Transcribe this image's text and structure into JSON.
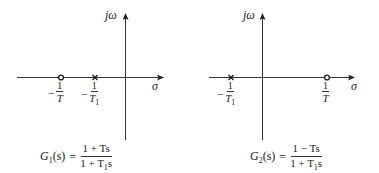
{
  "diagrams": [
    {
      "id": "left",
      "axes": {
        "vertical_label": "jω",
        "horizontal_label": "σ"
      },
      "markers": [
        {
          "type": "zero",
          "symbol": "o",
          "label_sign": "−",
          "label_num": "1",
          "label_den": "T",
          "label_den_sub": ""
        },
        {
          "type": "pole",
          "symbol": "×",
          "label_sign": "−",
          "label_num": "1",
          "label_den": "T",
          "label_den_sub": "1"
        }
      ],
      "transfer_function": {
        "lhs_name": "G",
        "lhs_sub": "1",
        "lhs_arg": "(s)",
        "equals": "=",
        "numerator": "1 + Ts",
        "denominator_pre": "1 + T",
        "denominator_sub": "1",
        "denominator_post": "s"
      }
    },
    {
      "id": "right",
      "axes": {
        "vertical_label": "jω",
        "horizontal_label": "σ"
      },
      "markers": [
        {
          "type": "pole",
          "symbol": "×",
          "label_sign": "−",
          "label_num": "1",
          "label_den": "T",
          "label_den_sub": "1"
        },
        {
          "type": "zero",
          "symbol": "o",
          "label_sign": "",
          "label_num": "1",
          "label_den": "T",
          "label_den_sub": ""
        }
      ],
      "transfer_function": {
        "lhs_name": "G",
        "lhs_sub": "2",
        "lhs_arg": "(s)",
        "equals": "=",
        "numerator": "1 − Ts",
        "denominator_pre": "1 + T",
        "denominator_sub": "1",
        "denominator_post": "s"
      }
    }
  ],
  "colors": {
    "ink": "#222222",
    "background": "#ffffff"
  }
}
